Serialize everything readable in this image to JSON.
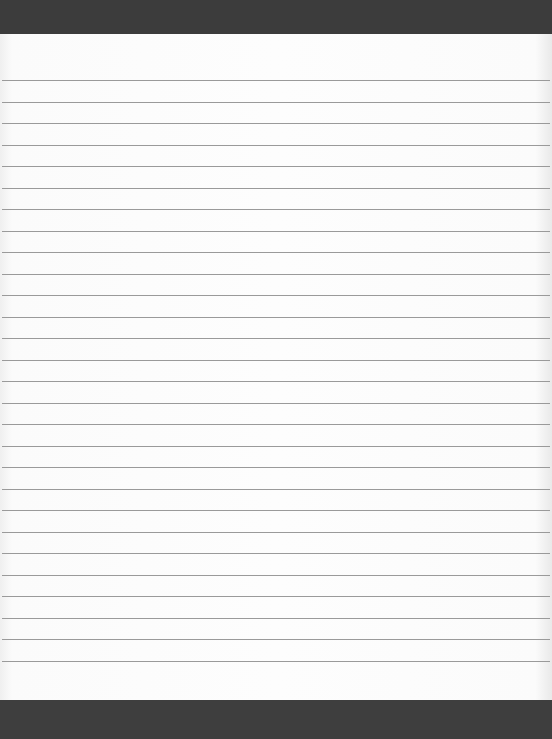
{
  "page": {
    "type": "blank lined paper",
    "colors": {
      "background": "#3f3f3f",
      "paper": "#fcfcfc",
      "rule": "#9a9a9a"
    },
    "rules": {
      "count": 28,
      "first_y": 80,
      "spacing": 21.5
    }
  }
}
